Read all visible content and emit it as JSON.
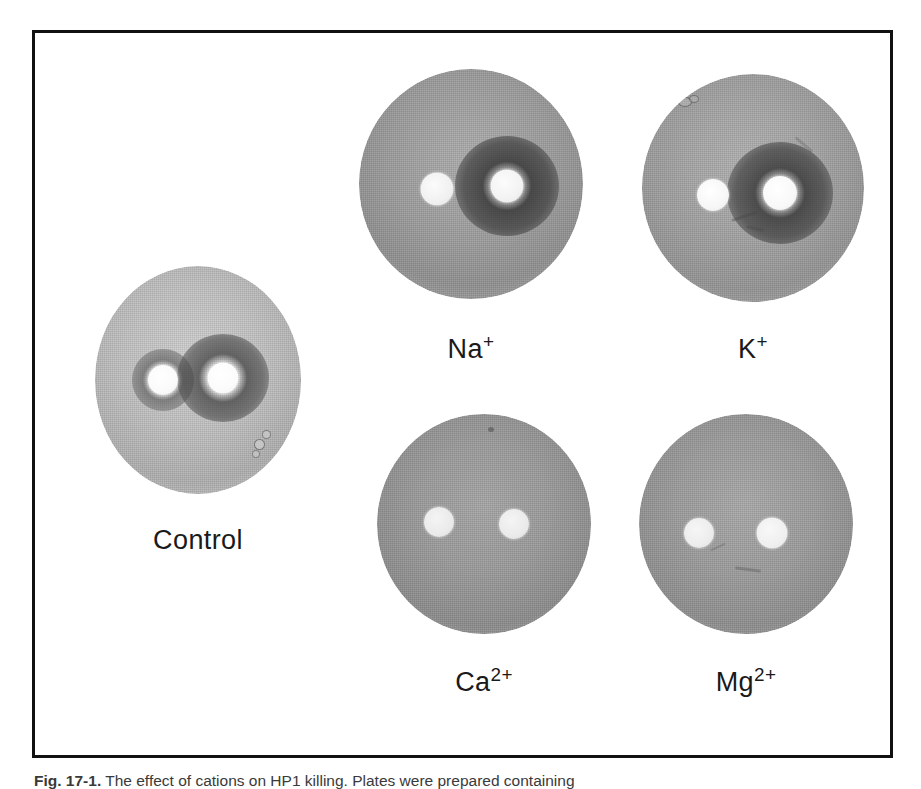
{
  "figure": {
    "caption_label": "Fig. 17-1.",
    "caption_text": "The effect of cations on HP1 killing. Plates were prepared containing",
    "border_color": "#111111",
    "background_color": "#ffffff"
  },
  "plates": [
    {
      "id": "control",
      "label": "Control",
      "label_sup": "",
      "agar_tone": "light",
      "left_disc": {
        "present": true,
        "halo": "faint",
        "halo_note": "small diffuse dark ring"
      },
      "right_disc": {
        "present": true,
        "halo": "strong",
        "halo_note": "large dark inhibition zone"
      }
    },
    {
      "id": "sodium",
      "label": "Na",
      "label_sup": "+",
      "agar_tone": "dark",
      "left_disc": {
        "present": true,
        "halo": "none",
        "halo_note": "no clearing"
      },
      "right_disc": {
        "present": true,
        "halo": "strong",
        "halo_note": "large dark inhibition zone"
      }
    },
    {
      "id": "potassium",
      "label": "K",
      "label_sup": "+",
      "agar_tone": "dark",
      "left_disc": {
        "present": true,
        "halo": "none",
        "halo_note": "no clearing"
      },
      "right_disc": {
        "present": true,
        "halo": "strong",
        "halo_note": "large dark inhibition zone"
      }
    },
    {
      "id": "calcium",
      "label": "Ca",
      "label_sup": "2+",
      "agar_tone": "mid",
      "left_disc": {
        "present": true,
        "halo": "none",
        "halo_note": "no clearing"
      },
      "right_disc": {
        "present": true,
        "halo": "none",
        "halo_note": "no clearing"
      }
    },
    {
      "id": "magnesium",
      "label": "Mg",
      "label_sup": "2+",
      "agar_tone": "mid",
      "left_disc": {
        "present": true,
        "halo": "none",
        "halo_note": "no clearing"
      },
      "right_disc": {
        "present": true,
        "halo": "none",
        "halo_note": "no clearing"
      }
    }
  ],
  "colors": {
    "rim": "#000000",
    "agar_light": "#b9b9b9",
    "agar_mid": "#a8a8a8",
    "agar_dark": "#8e8e8e",
    "halo": "#5a5a5a",
    "disc": "#f2f2f2",
    "label_text": "#1a1a1a"
  }
}
